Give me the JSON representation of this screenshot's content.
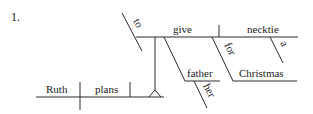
{
  "problem_number": "1.",
  "sentence_diagram": {
    "subject": "Ruth",
    "verb": "plans",
    "infinitive_marker": "to",
    "infinitive_verb": "give",
    "direct_object": "necktie",
    "object_modifier": "a",
    "indirect_object": "father",
    "indirect_object_modifier": "her",
    "preposition": "for",
    "prepositional_object": "Christmas"
  },
  "colors": {
    "line": "#2a2a2a",
    "text": "#1a1a1a",
    "background": "#ffffff"
  }
}
